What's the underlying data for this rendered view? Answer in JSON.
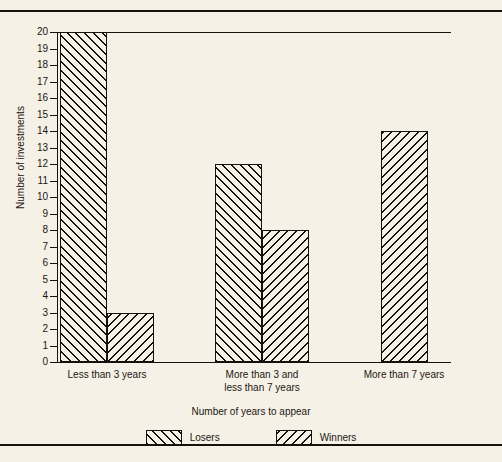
{
  "chart_data": {
    "type": "bar",
    "title": "",
    "xlabel": "Number of years to appear",
    "ylabel": "Number of investments",
    "categories": [
      "Less than 3 years",
      "More than 3 and\nless than 7 years",
      "More than 7 years"
    ],
    "series": [
      {
        "name": "Losers",
        "values": [
          20,
          12,
          null
        ],
        "hatch": "forward-slash"
      },
      {
        "name": "Winners",
        "values": [
          3,
          8,
          14
        ],
        "hatch": "back-slash"
      }
    ],
    "ylim": [
      0,
      20
    ],
    "ytick_labels": [
      "0",
      "1",
      "2",
      "3",
      "4",
      "5",
      "6",
      "7",
      "8",
      "9",
      "10",
      "11",
      "12",
      "13",
      "14",
      "15",
      "16",
      "17",
      "18",
      "19",
      "20"
    ],
    "grid": false,
    "legend_position": "bottom",
    "colors": {
      "background": "#f6f1e6",
      "ink": "#15120d",
      "bar_fill": "#f6f1e6"
    }
  },
  "legend": {
    "items": [
      {
        "label": "Losers"
      },
      {
        "label": "Winners"
      }
    ]
  }
}
